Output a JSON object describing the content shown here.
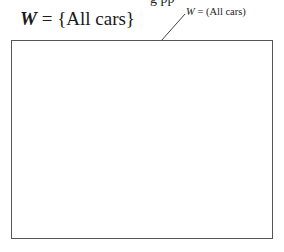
{
  "header_fragment": "g     pp",
  "title": {
    "symbol": "W",
    "equals": " = ",
    "set": "{All cars}"
  },
  "annotation": {
    "symbol": "W",
    "text": " = (All cars)"
  },
  "colors": {
    "line": "#555555",
    "text": "#1a1a1a"
  }
}
